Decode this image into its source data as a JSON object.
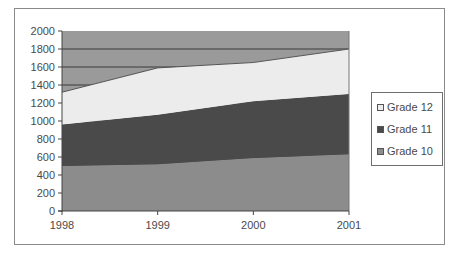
{
  "chart_data": {
    "type": "area",
    "stacked": true,
    "title": "",
    "xlabel": "",
    "ylabel": "",
    "categories": [
      "1998",
      "1999",
      "2000",
      "2001"
    ],
    "series": [
      {
        "name": "Grade 10",
        "values": [
          500,
          520,
          590,
          630
        ],
        "color": "#8c8c8c"
      },
      {
        "name": "Grade 11",
        "values": [
          460,
          550,
          630,
          670
        ],
        "color": "#4a4a4a"
      },
      {
        "name": "Grade 12",
        "values": [
          360,
          520,
          430,
          500
        ],
        "color": "#ececec"
      }
    ],
    "cumulative_tops": {
      "Grade 10": [
        500,
        520,
        590,
        630
      ],
      "Grade 11": [
        960,
        1070,
        1220,
        1300
      ],
      "Grade 12": [
        1320,
        1590,
        1650,
        1800
      ]
    },
    "ylim": [
      0,
      2000
    ],
    "yticks": [
      "0",
      "200",
      "400",
      "600",
      "800",
      "1000",
      "1200",
      "1400",
      "1600",
      "1800",
      "2000"
    ],
    "plot_background": "#9a9a9a",
    "grid": true,
    "legend_position": "right",
    "legend": [
      "Grade 12",
      "Grade 11",
      "Grade 10"
    ]
  }
}
